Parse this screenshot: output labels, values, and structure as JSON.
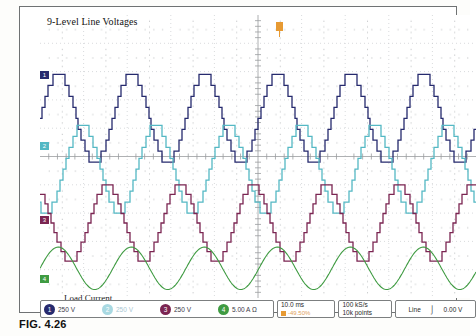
{
  "figure": {
    "caption": "FIG. 4.26"
  },
  "scope": {
    "wave_title": "9-Level Line Voltages",
    "load_label": "Load Current",
    "trigger_marker": "trigger-position-marker",
    "channels": [
      {
        "num": "1",
        "value": "250 V",
        "color": "#262a6e",
        "dim": false,
        "marker_top": 60
      },
      {
        "num": "2",
        "value": "250 V",
        "color": "#54b8c4",
        "dim": true,
        "marker_top": 131
      },
      {
        "num": "3",
        "value": "250 V",
        "color": "#7b2552",
        "dim": false,
        "marker_top": 205
      },
      {
        "num": "4",
        "value": "5.00 A Ω",
        "color": "#3f9b42",
        "dim": false,
        "marker_top": 264
      }
    ],
    "timebase": {
      "main": "10.0 ms",
      "sub": "-49.50%"
    },
    "acquisition": {
      "rate": "100 kS/s",
      "points": "10k points"
    },
    "trigger": {
      "source": "Line",
      "slope_icon": "rising-edge-icon",
      "level": "0.00 V"
    }
  },
  "chart_data": {
    "type": "line",
    "title": "9-Level Line Voltages",
    "xlabel": "Time",
    "ylabel": "Amplitude",
    "grid": true,
    "legend": "bottom",
    "x_div_ms": 10.0,
    "sample_rate": "100 kS/s",
    "record_length": "10k points",
    "cycles_visible": 6,
    "series": [
      {
        "name": "Channel 1 line voltage",
        "color": "#262a6e",
        "scale": "250 V",
        "waveform": "9-level staircase",
        "levels": [
          -4,
          -3,
          -2,
          -1,
          0,
          1,
          2,
          3,
          4
        ],
        "phase_deg": 0,
        "baseline_div": 6.35,
        "amplitude_div": 1.55,
        "period_px": 73
      },
      {
        "name": "Channel 2 line voltage",
        "color": "#54b8c4",
        "scale": "250 V",
        "waveform": "9-level staircase",
        "levels": [
          -4,
          -3,
          -2,
          -1,
          0,
          1,
          2,
          3,
          4
        ],
        "phase_deg": 120,
        "baseline_div": 4.55,
        "amplitude_div": 1.55,
        "period_px": 73
      },
      {
        "name": "Channel 3 line voltage",
        "color": "#7b2552",
        "scale": "250 V",
        "waveform": "9-level staircase",
        "levels": [
          -4,
          -3,
          -2,
          -1,
          0,
          1,
          2,
          3,
          4
        ],
        "phase_deg": 240,
        "baseline_div": 2.65,
        "amplitude_div": 1.35,
        "period_px": 73
      },
      {
        "name": "Channel 4 load current",
        "color": "#3f9b42",
        "scale": "5.00 A",
        "waveform": "sinusoid",
        "phase_deg": 0,
        "baseline_div": 1.05,
        "amplitude_div": 0.75,
        "period_px": 73
      }
    ]
  }
}
